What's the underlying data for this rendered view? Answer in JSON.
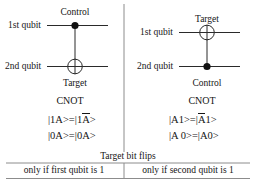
{
  "figure": {
    "divider_color": "#7a7a7a",
    "wire_color": "#2a2a2a",
    "text_color": "#151515",
    "left_panel": {
      "circuit": {
        "top_label": "Control",
        "bottom_label": "Target",
        "wire1_label": "1st qubit",
        "wire2_label": "2nd qubit",
        "control_marker": "filled-dot",
        "target_marker": "circle-plus"
      },
      "gate_name": "CNOT",
      "equations": [
        {
          "lhs": "|1A>",
          "eq": "=",
          "rhs_pre": "|1",
          "rhs_over": "A",
          "rhs_post": ">"
        },
        {
          "lhs": "|0A>",
          "eq": "=",
          "rhs_pre": " |0A",
          "rhs_over": "",
          "rhs_post": ">"
        }
      ],
      "caption": "only if first qubit is 1"
    },
    "right_panel": {
      "circuit": {
        "top_label": "Target",
        "bottom_label": "Control",
        "wire1_label": "1st qubit",
        "wire2_label": "2nd qubit",
        "control_marker": "filled-dot",
        "target_marker": "circle-plus"
      },
      "gate_name": "CNOT",
      "equations": [
        {
          "lhs": "|A1>",
          "eq": "=",
          "rhs_pre": "|",
          "rhs_over": "A",
          "rhs_post": "1>"
        },
        {
          "lhs": "|A 0>",
          "eq": "=",
          "rhs_pre": " |A0",
          "rhs_over": "",
          "rhs_post": ">"
        }
      ],
      "caption": "only if second qubit is 1"
    },
    "shared_caption": "Target bit flips"
  }
}
